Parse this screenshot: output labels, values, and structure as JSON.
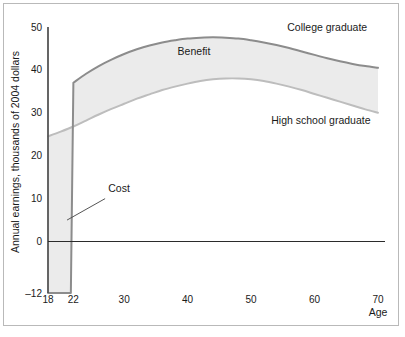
{
  "chart_data": {
    "type": "area",
    "title": "",
    "subtitle": "",
    "xlabel": "Age",
    "ylabel": "Annual earnings, thousands of 2004 dollars",
    "xlim": [
      18,
      70
    ],
    "ylim": [
      -12,
      50
    ],
    "grid": false,
    "legend_position": "inline-annotations",
    "xticks": [
      18,
      22,
      30,
      40,
      50,
      60,
      70
    ],
    "xtick_labels": [
      "18",
      "22",
      "30",
      "40",
      "50",
      "60",
      "70"
    ],
    "yticks": [
      -12,
      0,
      10,
      20,
      30,
      40,
      50
    ],
    "ytick_labels": [
      "–12",
      "0",
      "10",
      "20",
      "30",
      "40",
      "50"
    ],
    "zero_line": 0,
    "annotations": [
      {
        "text": "College graduate",
        "x": 62,
        "y": 49,
        "anchor": "middle"
      },
      {
        "text": "High school graduate",
        "x": 61,
        "y": 27.5,
        "anchor": "middle"
      },
      {
        "text": "Benefit",
        "x": 41,
        "y": 43.5,
        "anchor": "middle"
      },
      {
        "text": "Cost",
        "x": 27.5,
        "y": 11.5,
        "anchor": "start"
      }
    ],
    "series": [
      {
        "name": "High school graduate",
        "fill": "none",
        "x": [
          18,
          20,
          22,
          24,
          26,
          28,
          30,
          32,
          34,
          36,
          38,
          40,
          42,
          44,
          46,
          48,
          50,
          52,
          54,
          56,
          58,
          60,
          62,
          64,
          66,
          68,
          70
        ],
        "values": [
          24.5,
          25.6,
          26.8,
          28.2,
          29.6,
          30.9,
          32.1,
          33.3,
          34.3,
          35.3,
          36.1,
          36.8,
          37.4,
          37.8,
          38.0,
          38.0,
          37.8,
          37.4,
          36.8,
          36.1,
          35.3,
          34.4,
          33.5,
          32.6,
          31.7,
          30.8,
          30.0
        ]
      },
      {
        "name": "College graduate",
        "fill": "none",
        "x": [
          18,
          20,
          22,
          24,
          26,
          28,
          30,
          32,
          34,
          36,
          38,
          40,
          42,
          44,
          46,
          48,
          50,
          52,
          54,
          56,
          58,
          60,
          62,
          64,
          66,
          68,
          70
        ],
        "values": [
          -12.0,
          -12.0,
          37.0,
          39.1,
          40.9,
          42.4,
          43.7,
          44.8,
          45.7,
          46.4,
          46.9,
          47.3,
          47.5,
          47.6,
          47.5,
          47.3,
          46.9,
          46.4,
          45.8,
          45.1,
          44.3,
          43.5,
          42.7,
          42.0,
          41.4,
          40.9,
          40.5
        ]
      }
    ],
    "regions": [
      {
        "name": "Cost",
        "description": "Shaded area between the high school earnings line and the college graduate line (foregone earnings plus tuition) from age 18 to age 22, extending down to −12.",
        "x_range": [
          18,
          22
        ],
        "lower": -12,
        "fill_color": "#ebebeb"
      },
      {
        "name": "Benefit",
        "description": "Shaded area between the college graduate line and the high school graduate line from age 22 to age 70.",
        "x_range": [
          22,
          70
        ],
        "fill_color": "#ebebeb"
      }
    ],
    "colors": {
      "band_fill": "#ebebeb",
      "college_line": "#8c8c8c",
      "highschool_line": "#bdbdbd",
      "axis": "#555555",
      "zero_line": "#2b2b2b",
      "frame": "#b9b9b9",
      "background": "#ffffff",
      "text": "#1a1a1a"
    }
  }
}
